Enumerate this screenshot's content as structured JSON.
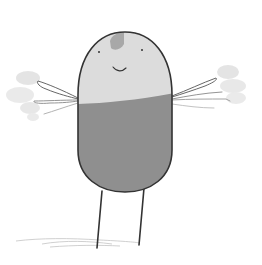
{
  "illustration": {
    "subject": "pill-shaped character with wing-like arms standing on two thin legs",
    "colors": {
      "background": "#ffffff",
      "body_top": "#dcdcdc",
      "body_bottom": "#8f8f8f",
      "head_spot": "#a8a8a8",
      "outline": "#333333",
      "smudge": "#d6d6d6",
      "shadow": "#c8c8c8"
    }
  }
}
